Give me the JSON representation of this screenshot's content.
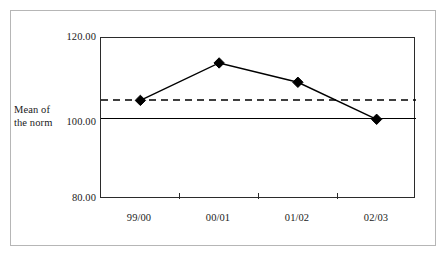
{
  "chart_data": {
    "type": "line",
    "title": "",
    "subtitle": "",
    "xlabel": "",
    "ylabel": "Mean of the norm",
    "ylabel_lines": [
      "Mean of",
      "the norm"
    ],
    "categories": [
      "99/00",
      "00/01",
      "01/02",
      "02/03"
    ],
    "series": [
      {
        "name": "Mean of the norm",
        "marker": "diamond",
        "line_style": "solid",
        "color": "#000000",
        "values": [
          104.5,
          113.8,
          109.0,
          99.8
        ]
      }
    ],
    "reference_lines": [
      {
        "name": "norm-baseline",
        "label": "100.00",
        "value": 100.0,
        "line_style": "solid",
        "color": "#000000"
      },
      {
        "name": "mean-line",
        "label": "",
        "value": 104.6,
        "line_style": "dashed",
        "color": "#000000"
      }
    ],
    "ylim": [
      80.0,
      120.0
    ],
    "ytick_values": [
      80.0,
      100.0,
      120.0
    ],
    "ytick_labels": [
      "80.00",
      "100.00",
      "120.00"
    ],
    "grid": false,
    "legend": "none",
    "legend_position": "none",
    "axis_line_color": "#2b2b2b",
    "frame_color": "#b6b6b6",
    "background_color": "#ffffff"
  },
  "axis": {
    "y_label_line1": "Mean of",
    "y_label_line2": "the norm",
    "y_tick_top": "120.00",
    "y_tick_mid": "100.00",
    "y_tick_bottom": "80.00",
    "x_tick_1": "99/00",
    "x_tick_2": "00/01",
    "x_tick_3": "01/02",
    "x_tick_4": "02/03"
  }
}
